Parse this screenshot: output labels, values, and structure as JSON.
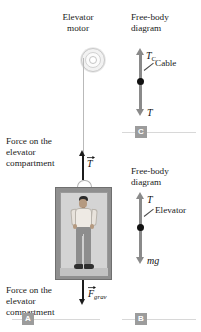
{
  "figure": {
    "type": "physics-free-body-diagram",
    "title_motor": "Elevator\nmotor",
    "label_force_top": "Force on the\nelevator\ncompartment",
    "label_force_bottom": "Force on the\nelevator\ncompartment"
  },
  "scene": {
    "tension_label": "T",
    "gravity_label": "F",
    "gravity_subscript": "grav"
  },
  "fbd_cable": {
    "heading": "Free-body\ndiagram",
    "up_force": "T",
    "up_force_subscript": "C",
    "object_label": "Cable",
    "down_force": "T"
  },
  "fbd_elevator": {
    "heading": "Free-body\ndiagram",
    "up_force": "T",
    "object_label": "Elevator",
    "down_force": "mg"
  },
  "markers": {
    "a": "A",
    "b": "B",
    "c": "C"
  },
  "colors": {
    "arrow_black": "#1c1c1c",
    "arrow_gray": "#8a8a8a",
    "dot": "#111111",
    "car_frame": "#8f8f8f",
    "car_interior": "#d4d4d4",
    "badge": "#9c9c9c",
    "cable": "#b9b9b9"
  }
}
